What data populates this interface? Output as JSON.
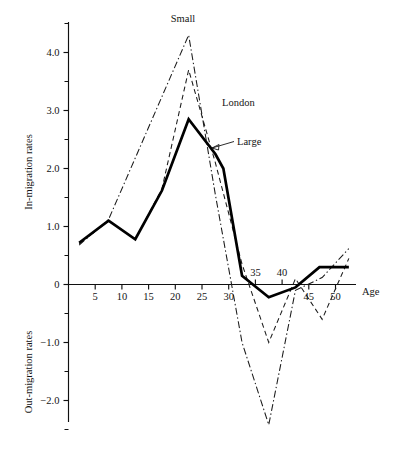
{
  "chart_data": {
    "type": "line",
    "title": "",
    "xlabel": "Age",
    "ylabel_upper": "In-migration rates",
    "ylabel_lower": "Out-migration rates",
    "grid": false,
    "legend_position": "inline-annotations",
    "xlim": [
      0,
      54
    ],
    "ylim": [
      -2.75,
      4.7
    ],
    "x_ticks_major": [
      5,
      10,
      15,
      20,
      25,
      30,
      35,
      40,
      45,
      50
    ],
    "x_tick_labels": [
      "5",
      "10",
      "15",
      "20",
      "25",
      "30",
      "35",
      "40",
      "45",
      "50"
    ],
    "y_ticks_major": [
      4.0,
      3.0,
      2.0,
      1.0,
      0,
      -1.0,
      -2.0
    ],
    "y_tick_labels": [
      "4.0",
      "3.0",
      "2.0",
      "1.0",
      "0",
      "−1.0",
      "−2.0"
    ],
    "y_ticks_minor": [
      4.5,
      3.5,
      2.5,
      1.5,
      0.5,
      -0.5,
      -1.5,
      -2.5
    ],
    "series": [
      {
        "name": "Large",
        "style": "solid",
        "color": "#000000",
        "x": [
          2,
          7.5,
          12.5,
          17.5,
          22.5,
          27.5,
          29,
          32.5,
          37.5,
          42.5,
          47,
          52.5
        ],
        "values": [
          0.72,
          1.1,
          0.78,
          1.62,
          2.85,
          2.25,
          2.0,
          0.15,
          -0.22,
          -0.05,
          0.3,
          0.3
        ]
      },
      {
        "name": "London",
        "style": "dashed",
        "color": "#1a1a1a",
        "x": [
          2,
          7.5,
          12.5,
          17.5,
          22.5,
          27.5,
          32.5,
          37.5,
          42.5,
          47.5,
          52.5
        ],
        "values": [
          0.7,
          1.1,
          0.78,
          1.65,
          3.7,
          2.1,
          0.35,
          -1.0,
          0.1,
          -0.6,
          0.45
        ]
      },
      {
        "name": "Small",
        "style": "dash-dot",
        "color": "#1a1a1a",
        "x": [
          2,
          7.5,
          22.5,
          27.5,
          32.5,
          37.5,
          42.5,
          47.5,
          52.5
        ],
        "values": [
          0.68,
          1.12,
          4.3,
          1.55,
          -1.0,
          -2.42,
          -0.1,
          0.12,
          0.62
        ]
      }
    ],
    "annotations": [
      {
        "label": "Small",
        "x": 183,
        "y": 22,
        "anchor": "middle"
      },
      {
        "label": "London",
        "x": 222,
        "y": 106,
        "anchor": "start"
      },
      {
        "label": "Large",
        "x": 237,
        "y": 145,
        "anchor": "start"
      }
    ]
  }
}
